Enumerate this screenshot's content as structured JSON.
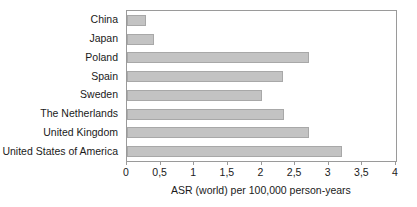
{
  "chart_data": {
    "type": "bar",
    "orientation": "horizontal",
    "title": "",
    "subtitle": "",
    "xlabel": "ASR (world) per 100,000 person-years",
    "ylabel": "",
    "xlim": [
      0,
      4
    ],
    "x_tick_labels": [
      "0",
      "0,5",
      "1",
      "1,5",
      "2",
      "2,5",
      "3",
      "3,5",
      "4"
    ],
    "x_tick_values": [
      0,
      0.5,
      1,
      1.5,
      2,
      2.5,
      3,
      3.5,
      4
    ],
    "grid": false,
    "legend": null,
    "decimal_separator": ",",
    "bar_color": "#c3c3c3",
    "bar_border_color": "#a8a8a8",
    "axis_color": "#9a9a9a",
    "categories": [
      "China",
      "Japan",
      "Poland",
      "Spain",
      "Sweden",
      "The Netherlands",
      "United Kingdom",
      "United States of America"
    ],
    "values": [
      0.28,
      0.4,
      2.7,
      2.32,
      2.0,
      2.33,
      2.7,
      3.2
    ]
  }
}
